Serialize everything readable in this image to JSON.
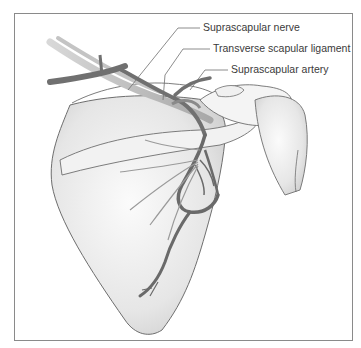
{
  "figure": {
    "labels": [
      {
        "id": "suprascapular-nerve",
        "text": "Suprascapular nerve"
      },
      {
        "id": "transverse-scapular-ligament",
        "text": "Transverse scapular ligament"
      },
      {
        "id": "suprascapular-artery",
        "text": "Suprascapular artery"
      }
    ]
  },
  "colors": {
    "frame": "#8a8a8a",
    "bone_fill": "#ececec",
    "bone_outline": "#6e6e6e",
    "vessel": "#6a6a6a",
    "nerve": "#b8b8b8",
    "label_text": "#3a3a3a"
  }
}
